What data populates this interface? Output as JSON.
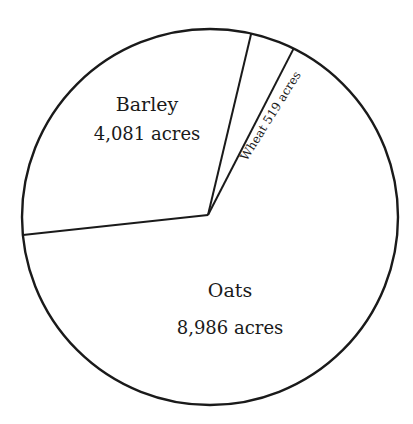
{
  "chart_data": {
    "type": "pie",
    "title": "",
    "unit": "acres",
    "categories": [
      "Wheat",
      "Barley",
      "Oats"
    ],
    "values": [
      519,
      4081,
      8986
    ],
    "labels": [
      {
        "name": "Wheat",
        "value_text": "519 acres"
      },
      {
        "name": "Barley",
        "value_text": "4,081 acres"
      },
      {
        "name": "Oats",
        "value_text": "8,986 acres"
      }
    ],
    "start_angle_deg": 63.6,
    "direction": "counterclockwise",
    "legend": "none",
    "fill": "none",
    "stroke": "#1a1a1a"
  },
  "labels": {
    "barley_name": "Barley",
    "barley_value": "4,081 acres",
    "wheat_text": "Wheat 519 acres",
    "oats_name": "Oats",
    "oats_value": "8,986 acres"
  }
}
